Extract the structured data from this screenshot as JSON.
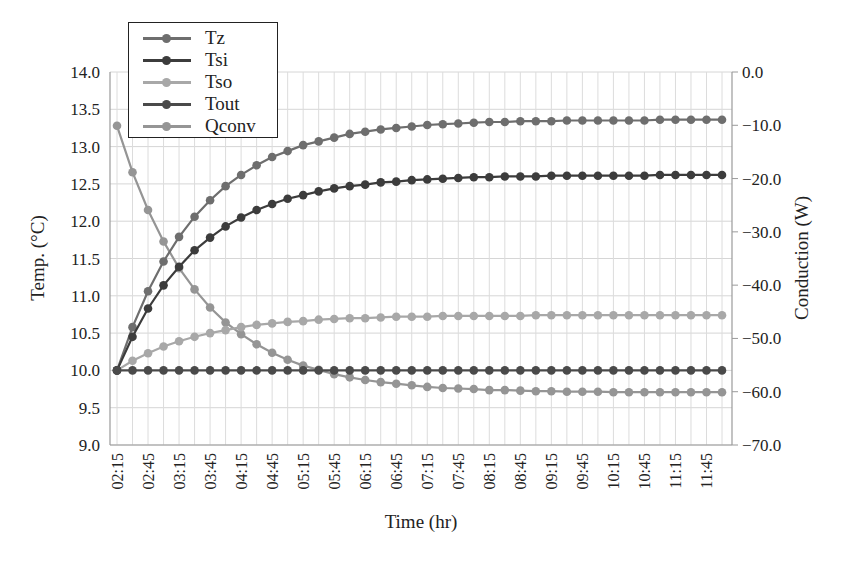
{
  "chart_data": {
    "type": "line",
    "title": "",
    "xlabel": "Time (hr)",
    "ylabel": "Temp. (°C)",
    "y2label": "Conduction (W)",
    "ylim": [
      9.0,
      14.0
    ],
    "y2lim": [
      -70.0,
      0.0
    ],
    "yticks": [
      "14.0",
      "13.5",
      "13.0",
      "12.5",
      "12.0",
      "11.5",
      "11.0",
      "10.5",
      "10.0",
      "9.5",
      "9.0"
    ],
    "y2ticks": [
      "0.0",
      "−10.0",
      "−20.0",
      "−30.0",
      "−40.0",
      "−50.0",
      "−60.0",
      "−70.0"
    ],
    "xtick_labels": [
      "02:15",
      "02:45",
      "03:15",
      "03:45",
      "04:15",
      "04:45",
      "05:15",
      "05:45",
      "06:15",
      "06:45",
      "07:15",
      "07:45",
      "08:15",
      "08:45",
      "09:15",
      "09:45",
      "10:15",
      "10:45",
      "11:15",
      "11:45"
    ],
    "x": [
      "02:15",
      "02:30",
      "02:45",
      "03:00",
      "03:15",
      "03:30",
      "03:45",
      "04:00",
      "04:15",
      "04:30",
      "04:45",
      "05:00",
      "05:15",
      "05:30",
      "05:45",
      "06:00",
      "06:15",
      "06:30",
      "06:45",
      "07:00",
      "07:15",
      "07:30",
      "07:45",
      "08:00",
      "08:15",
      "08:30",
      "08:45",
      "09:00",
      "09:15",
      "09:30",
      "09:45",
      "10:00",
      "10:15",
      "10:30",
      "10:45",
      "11:00",
      "11:15",
      "11:30",
      "11:45",
      "12:00"
    ],
    "grid": true,
    "legend_position": "upper-left",
    "series": [
      {
        "name": "Tz",
        "axis": "left",
        "color": "#6e6e6e",
        "values": [
          10.0,
          10.58,
          11.06,
          11.46,
          11.79,
          12.06,
          12.28,
          12.47,
          12.62,
          12.75,
          12.86,
          12.94,
          13.02,
          13.07,
          13.12,
          13.17,
          13.2,
          13.23,
          13.25,
          13.27,
          13.29,
          13.3,
          13.31,
          13.32,
          13.33,
          13.33,
          13.34,
          13.34,
          13.34,
          13.35,
          13.35,
          13.35,
          13.35,
          13.35,
          13.35,
          13.36,
          13.36,
          13.36,
          13.36,
          13.36
        ]
      },
      {
        "name": "Tsi",
        "axis": "left",
        "color": "#3c3c3c",
        "values": [
          10.0,
          10.45,
          10.83,
          11.14,
          11.39,
          11.61,
          11.78,
          11.93,
          12.05,
          12.15,
          12.23,
          12.3,
          12.35,
          12.4,
          12.44,
          12.47,
          12.49,
          12.52,
          12.53,
          12.55,
          12.56,
          12.57,
          12.58,
          12.59,
          12.59,
          12.6,
          12.6,
          12.6,
          12.61,
          12.61,
          12.61,
          12.61,
          12.61,
          12.61,
          12.61,
          12.62,
          12.62,
          12.62,
          12.62,
          12.62
        ]
      },
      {
        "name": "Tso",
        "axis": "left",
        "color": "#a8a8a8",
        "values": [
          10.0,
          10.13,
          10.23,
          10.32,
          10.39,
          10.45,
          10.5,
          10.54,
          10.58,
          10.61,
          10.63,
          10.65,
          10.66,
          10.68,
          10.69,
          10.7,
          10.7,
          10.71,
          10.72,
          10.72,
          10.72,
          10.73,
          10.73,
          10.73,
          10.73,
          10.73,
          10.73,
          10.74,
          10.74,
          10.74,
          10.74,
          10.74,
          10.74,
          10.74,
          10.74,
          10.74,
          10.74,
          10.74,
          10.74,
          10.74
        ]
      },
      {
        "name": "Tout",
        "axis": "left",
        "color": "#4a4a4a",
        "values": [
          10.0,
          10.0,
          10.0,
          10.0,
          10.0,
          10.0,
          10.0,
          10.0,
          10.0,
          10.0,
          10.0,
          10.0,
          10.0,
          10.0,
          10.0,
          10.0,
          10.0,
          10.0,
          10.0,
          10.0,
          10.0,
          10.0,
          10.0,
          10.0,
          10.0,
          10.0,
          10.0,
          10.0,
          10.0,
          10.0,
          10.0,
          10.0,
          10.0,
          10.0,
          10.0,
          10.0,
          10.0,
          10.0,
          10.0,
          10.0
        ]
      },
      {
        "name": "Qconv",
        "axis": "right",
        "color": "#959595",
        "values": [
          -10.1,
          -18.8,
          -25.9,
          -31.8,
          -36.8,
          -40.8,
          -44.2,
          -47.0,
          -49.2,
          -51.1,
          -52.7,
          -54.0,
          -55.1,
          -55.9,
          -56.7,
          -57.3,
          -57.8,
          -58.2,
          -58.5,
          -58.8,
          -59.1,
          -59.3,
          -59.4,
          -59.5,
          -59.7,
          -59.7,
          -59.8,
          -59.9,
          -59.9,
          -60.0,
          -60.0,
          -60.0,
          -60.1,
          -60.1,
          -60.1,
          -60.1,
          -60.1,
          -60.1,
          -60.1,
          -60.1
        ]
      }
    ]
  }
}
